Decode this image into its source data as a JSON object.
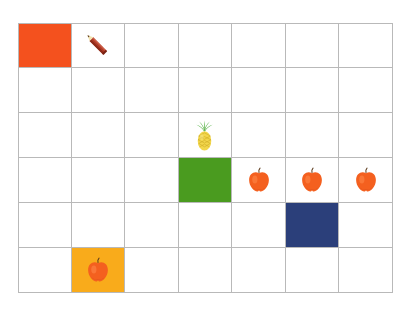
{
  "canvas": {
    "width": 412,
    "height": 313,
    "background": "#ffffff"
  },
  "grid": {
    "columns": 7,
    "rows": 6,
    "left": 18,
    "top": 23,
    "width": 375,
    "height": 270,
    "line_color": "#b9b9b9",
    "line_width": 1
  },
  "palette": {
    "orange_red": "#f4511e",
    "green": "#4a9b1f",
    "navy": "#2b3f7a",
    "amber": "#f9ab1b",
    "apple_body": "#f4601f",
    "apple_stem": "#5c3a1a",
    "pineapple_body": "#f2d64b",
    "pineapple_leaf": "#3fa62b",
    "pencil_body": "#b03a26",
    "pencil_tip": "#f2e3b0",
    "pencil_lead": "#5c3a1a"
  },
  "cells": [
    {
      "row": 1,
      "col": 1,
      "fill": "#f4511e",
      "icon": "",
      "name": "cell-r1c1-orange-square"
    },
    {
      "row": 1,
      "col": 2,
      "fill": "",
      "icon": "pencil-icon",
      "name": "cell-r1c2-pencil"
    },
    {
      "row": 3,
      "col": 4,
      "fill": "",
      "icon": "pineapple-icon",
      "name": "cell-r3c4-pineapple"
    },
    {
      "row": 4,
      "col": 4,
      "fill": "#4a9b1f",
      "icon": "",
      "name": "cell-r4c4-green-square"
    },
    {
      "row": 4,
      "col": 5,
      "fill": "",
      "icon": "apple-icon",
      "name": "cell-r4c5-apple"
    },
    {
      "row": 4,
      "col": 6,
      "fill": "",
      "icon": "apple-icon",
      "name": "cell-r4c6-apple"
    },
    {
      "row": 4,
      "col": 7,
      "fill": "",
      "icon": "apple-icon",
      "name": "cell-r4c7-apple"
    },
    {
      "row": 5,
      "col": 6,
      "fill": "#2b3f7a",
      "icon": "",
      "name": "cell-r5c6-navy-square"
    },
    {
      "row": 6,
      "col": 2,
      "fill": "#f9ab1b",
      "icon": "apple-icon",
      "name": "cell-r6c2-amber-apple"
    }
  ],
  "counts": {
    "apples": 4,
    "pineapples": 1,
    "pencils": 1,
    "filled_squares": 4
  }
}
